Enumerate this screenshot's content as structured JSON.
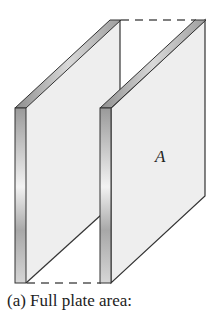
{
  "figure": {
    "plate_label": "A",
    "caption": "(a) Full plate area:",
    "colors": {
      "face": "#eeeeee",
      "edge_light": "#d8d8d8",
      "edge_dark": "#8a8a8a",
      "line": "#333333",
      "dash": "#555555"
    }
  }
}
